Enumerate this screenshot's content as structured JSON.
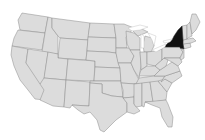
{
  "map": {
    "region": "Contiguous United States",
    "highlighted_states": [
      "New York"
    ],
    "colors": {
      "base_fill": "#dcdcdc",
      "border": "#8a8a8a",
      "highlight_fill": "#111111",
      "background": "#ffffff",
      "lakes": "#ffffff"
    }
  }
}
